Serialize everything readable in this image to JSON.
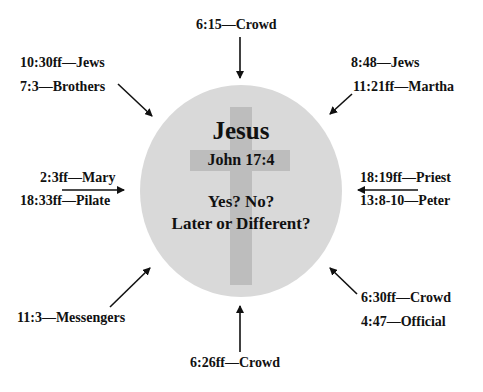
{
  "center": {
    "title": "Jesus",
    "reference": "John 17:4",
    "question_line1": "Yes? No?",
    "question_line2": "Later or Different?"
  },
  "colors": {
    "circle": "#d9d9d9",
    "cross": "#bdbdbd",
    "text": "#111111",
    "background": "#ffffff"
  },
  "labels": {
    "top": "6:15—Crowd",
    "top_left_1": "10:30ff—Jews",
    "top_left_2": "7:3—Brothers",
    "top_right_1": "8:48—Jews",
    "top_right_2": "11:21ff—Martha",
    "left_1": "2:3ff—Mary",
    "left_2": "18:33ff—Pilate",
    "right_1": "18:19ff—Priest",
    "right_2": "13:8-10—Peter",
    "bottom_left": "11:3—Messengers",
    "bottom_right_1": "6:30ff—Crowd",
    "bottom_right_2": "4:47—Official",
    "bottom": "6:26ff—Crowd"
  }
}
